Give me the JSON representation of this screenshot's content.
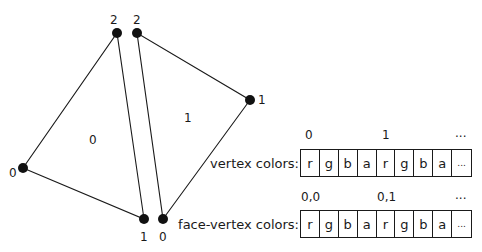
{
  "triangles": [
    {
      "face_label": "0",
      "vertices": [
        {
          "label": "0",
          "x": 23,
          "y": 168
        },
        {
          "label": "1",
          "x": 144,
          "y": 219
        },
        {
          "label": "2",
          "x": 117,
          "y": 33
        }
      ],
      "face_label_pos": [
        92,
        140
      ]
    },
    {
      "face_label": "1",
      "vertices": [
        {
          "label": "0",
          "x": 163,
          "y": 219
        },
        {
          "label": "1",
          "x": 250,
          "y": 100
        },
        {
          "label": "2",
          "x": 137,
          "y": 33
        }
      ],
      "face_label_pos": [
        186,
        118
      ]
    }
  ],
  "tables": {
    "vertex": {
      "label": "vertex colors:",
      "indices": [
        "0",
        "1",
        "..."
      ],
      "cells": [
        "r",
        "g",
        "b",
        "a",
        "r",
        "g",
        "b",
        "a",
        "..."
      ]
    },
    "face_vertex": {
      "label": "face-vertex colors:",
      "indices": [
        "0,0",
        "0,1",
        "..."
      ],
      "cells": [
        "r",
        "g",
        "b",
        "a",
        "r",
        "g",
        "b",
        "a",
        "..."
      ]
    }
  },
  "colors": {
    "stroke": "#1a1a1a",
    "background": "#ffffff"
  }
}
